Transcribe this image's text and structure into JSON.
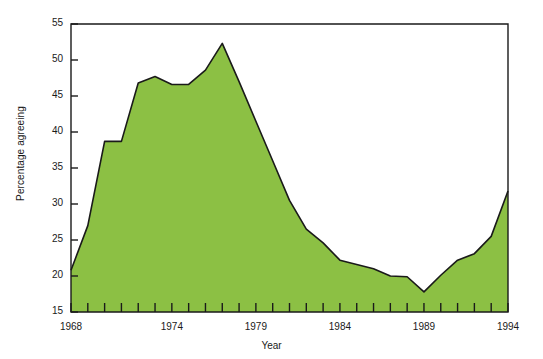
{
  "chart_data": {
    "type": "area",
    "title": "",
    "xlabel": "Year",
    "ylabel": "Percentage agreeing",
    "xlim": [
      1968,
      1994
    ],
    "ylim": [
      15,
      55
    ],
    "grid": false,
    "legend": null,
    "fill_color": "#8cc044",
    "line_color": "#1a1a1a",
    "background_color": "#ffffff",
    "y_ticks": [
      15,
      20,
      25,
      30,
      35,
      40,
      45,
      50,
      55
    ],
    "x_ticks": [
      1968,
      1969,
      1970,
      1971,
      1972,
      1973,
      1974,
      1975,
      1976,
      1977,
      1978,
      1979,
      1980,
      1981,
      1982,
      1983,
      1984,
      1985,
      1986,
      1987,
      1988,
      1989,
      1990,
      1991,
      1992,
      1993,
      1994
    ],
    "x_tick_labels": [
      "1968",
      "1974",
      "1979",
      "1984",
      "1989",
      "1994"
    ],
    "x_tick_label_values": [
      1968,
      1974,
      1979,
      1984,
      1989,
      1994
    ],
    "x": [
      1968,
      1969,
      1970,
      1971,
      1972,
      1973,
      1974,
      1975,
      1976,
      1977,
      1978,
      1979,
      1980,
      1981,
      1982,
      1983,
      1984,
      1985,
      1986,
      1987,
      1988,
      1989,
      1990,
      1991,
      1992,
      1993,
      1994
    ],
    "values": [
      20.8,
      27.0,
      38.7,
      38.7,
      46.8,
      47.7,
      46.6,
      46.6,
      48.6,
      52.3,
      47.0,
      41.5,
      36.0,
      30.5,
      26.5,
      24.6,
      22.2,
      21.6,
      21.0,
      20.0,
      19.9,
      17.8,
      20.1,
      22.2,
      23.1,
      25.5,
      31.8
    ]
  },
  "axis": {
    "ylabel": "Percentage agreeing",
    "xlabel": "Year"
  }
}
